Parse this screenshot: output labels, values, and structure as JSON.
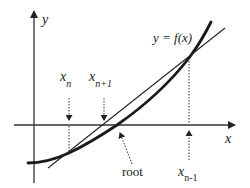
{
  "diagram": {
    "axes": {
      "x_label": "x",
      "y_label": "y"
    },
    "curve_label": "y = f(x)",
    "points": {
      "x_n": {
        "base": "x",
        "sub": "n"
      },
      "x_n_plus_1": {
        "base": "x",
        "sub": "n+1"
      },
      "x_n_minus_1": {
        "base": "x",
        "sub": "n-1"
      }
    },
    "root_label": "root",
    "colors": {
      "stroke": "#222222",
      "background": "#ffffff"
    }
  }
}
